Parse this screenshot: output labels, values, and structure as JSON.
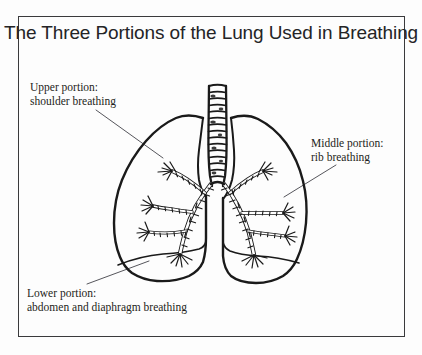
{
  "figure": {
    "title": "The Three Portions of the Lung Used in Breathing",
    "frame_color": "#3a3a3c",
    "background_color": "#fdfdfd",
    "ink_color": "#1a1a1a"
  },
  "labels": {
    "upper": {
      "line1": "Upper portion:",
      "line2": "shoulder breathing",
      "points_to": "upper lobe of left lung"
    },
    "middle": {
      "line1": "Middle portion:",
      "line2": "rib breathing",
      "points_to": "mid/lateral wall of right lung"
    },
    "lower": {
      "line1": "Lower portion:",
      "line2": "abdomen and diaphragm breathing",
      "points_to": "lower base of left lung"
    }
  },
  "illustration": {
    "trachea_rings": 14,
    "left_lung_name": "left-lung",
    "right_lung_name": "right-lung",
    "bronchi_name": "bronchial-tree"
  }
}
